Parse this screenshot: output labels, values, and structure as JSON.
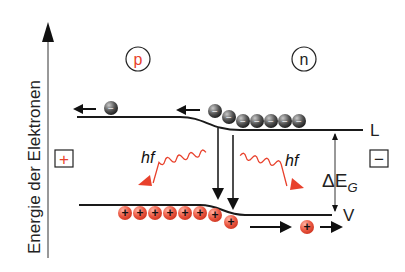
{
  "axis": {
    "label": "Energie der Elektronen"
  },
  "regions": {
    "p_label": "p",
    "n_label": "n"
  },
  "bands": {
    "conduction_label": "L",
    "valence_label": "V"
  },
  "gap": {
    "label_delta": "ΔE",
    "label_sub": "G"
  },
  "photons": {
    "left_label": "hf",
    "right_label": "hf"
  },
  "terminals": {
    "plus": "+",
    "minus": "−"
  },
  "carriers": {
    "electron_sign": "−",
    "hole_sign": "+",
    "electron_count_n": 7,
    "hole_count_p": 9
  },
  "colors": {
    "red": "#e8412c",
    "line": "#1a1a1a",
    "electron": "#555555"
  }
}
